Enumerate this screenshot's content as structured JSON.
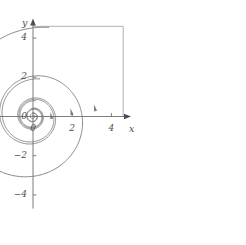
{
  "figure": {
    "kind": "phase-portrait",
    "background_color": "#ffffff",
    "curve_color": "#808080",
    "axis_color": "#6e6e6e",
    "frame_color": "#a8a8a8",
    "label_color": "#4d4d4d"
  },
  "axes": {
    "x_label": "x",
    "y_label": "y",
    "x_ticks": [
      {
        "value": -4,
        "label": "−4"
      },
      {
        "value": -2,
        "label": "−2"
      },
      {
        "value": 0,
        "label": "0"
      },
      {
        "value": 2,
        "label": "2"
      },
      {
        "value": 4,
        "label": "4"
      }
    ],
    "y_ticks": [
      {
        "value": 4,
        "label": "4"
      },
      {
        "value": 2,
        "label": "2"
      },
      {
        "value": 0,
        "label": "0"
      },
      {
        "value": -2,
        "label": "−2"
      },
      {
        "value": -4,
        "label": "−4"
      }
    ],
    "xlim": [
      -4.7,
      5.0
    ],
    "ylim": [
      -4.7,
      5.0
    ],
    "x_axis_arrow": true,
    "y_axis_arrow": true
  },
  "frame": {
    "visible": true,
    "x_from": 0.0,
    "x_to": 4.6,
    "y_from": 0.0,
    "y_to": 4.6
  },
  "chart_data": {
    "type": "line",
    "title": "",
    "xlabel": "x",
    "ylabel": "y",
    "xlim": [
      -4.7,
      5.0
    ],
    "ylim": [
      -4.7,
      5.0
    ],
    "grid": false,
    "legend": null,
    "equilibrium": {
      "x": 0,
      "y": 0,
      "classification": "stable spiral"
    },
    "spiral_model": "r(theta) = r0 * exp(k * theta), counterclockwise inward",
    "series": [
      {
        "name": "trajectory-outer",
        "r0": 4.62,
        "k": -0.125,
        "theta_start_deg": 80,
        "theta_end_deg": 1180,
        "direction": "counterclockwise-inward"
      },
      {
        "name": "trajectory-middle",
        "r0": 1.95,
        "k": -0.125,
        "theta_start_deg": 80,
        "theta_end_deg": 1180,
        "direction": "counterclockwise-inward"
      },
      {
        "name": "trajectory-inner",
        "r0": 0.82,
        "k": -0.125,
        "theta_start_deg": 80,
        "theta_end_deg": 1180,
        "direction": "counterclockwise-inward"
      }
    ],
    "arrows": [
      {
        "name": "flow-arrow-outer",
        "x": 3.15,
        "y": 0.45,
        "points": "up-inward"
      },
      {
        "name": "flow-arrow-middle",
        "x": 1.95,
        "y": 0.25,
        "points": "up-inward"
      },
      {
        "name": "flow-arrow-inner",
        "x": 0.92,
        "y": 0.05,
        "points": "up-inward"
      }
    ]
  }
}
